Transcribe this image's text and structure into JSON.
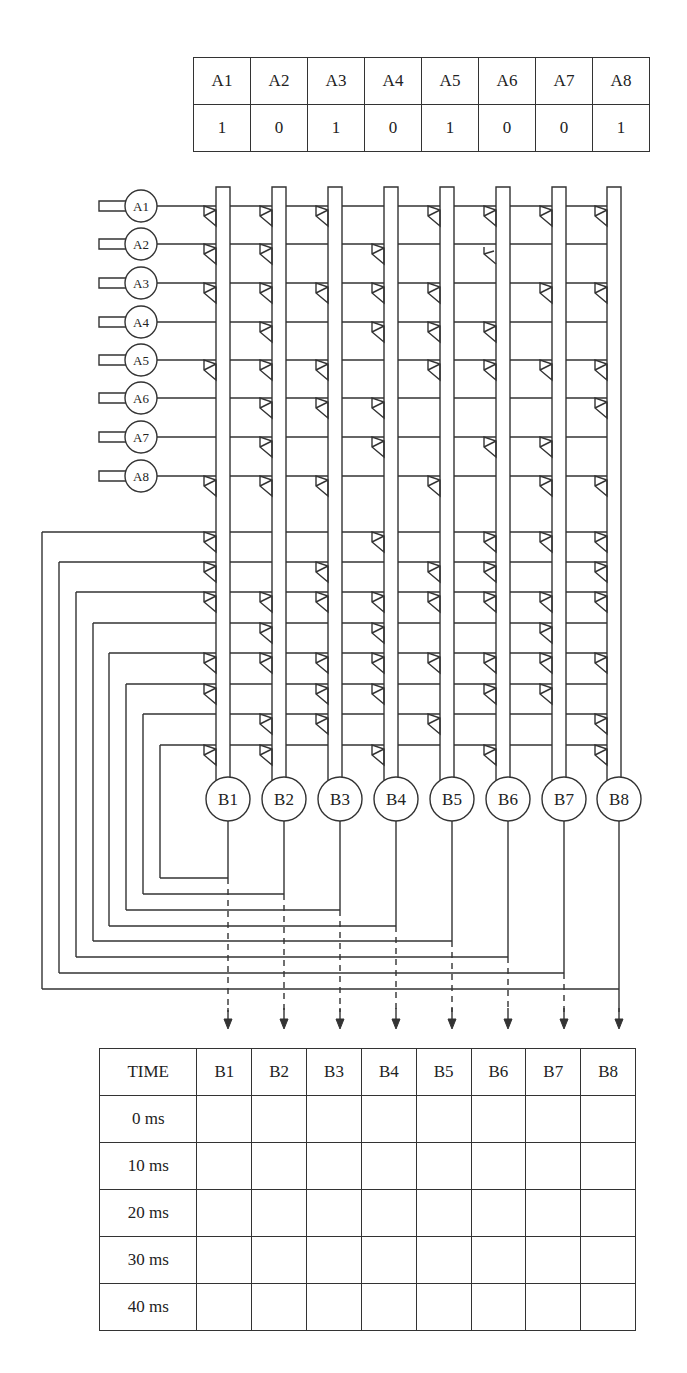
{
  "input_pattern_table": {
    "headers": [
      "A1",
      "A2",
      "A3",
      "A4",
      "A5",
      "A6",
      "A7",
      "A8"
    ],
    "values": [
      "1",
      "0",
      "1",
      "0",
      "1",
      "0",
      "0",
      "1"
    ]
  },
  "input_neurons": {
    "labels": [
      "A1",
      "A2",
      "A3",
      "A4",
      "A5",
      "A6",
      "A7",
      "A8"
    ]
  },
  "output_neurons": {
    "labels": [
      "B1",
      "B2",
      "B3",
      "B4",
      "B5",
      "B6",
      "B7",
      "B8"
    ]
  },
  "synapses": {
    "input_rows": [
      [
        1,
        2,
        3,
        5,
        6,
        7,
        8
      ],
      [
        1,
        2,
        4,
        6
      ],
      [
        1,
        2,
        3,
        4,
        5,
        7,
        8
      ],
      [
        2,
        4,
        5,
        6
      ],
      [
        1,
        2,
        3,
        5,
        6,
        7,
        8
      ],
      [
        2,
        3,
        4,
        8
      ],
      [
        2,
        4,
        6,
        7
      ],
      [
        1,
        2,
        3,
        5,
        7,
        8
      ]
    ],
    "open_synapses": [
      {
        "row": 2,
        "col": 6
      }
    ],
    "feedback_rows": [
      {
        "source": "B8",
        "cols": [
          1,
          4,
          6,
          7,
          8
        ]
      },
      {
        "source": "B7",
        "cols": [
          1,
          3,
          5,
          6,
          8
        ]
      },
      {
        "source": "B6",
        "cols": [
          1,
          2,
          3,
          4,
          5,
          6,
          7,
          8
        ]
      },
      {
        "source": "B5",
        "cols": [
          2,
          4,
          7
        ]
      },
      {
        "source": "B4",
        "cols": [
          1,
          2,
          3,
          4,
          5,
          6,
          7,
          8
        ]
      },
      {
        "source": "B3",
        "cols": [
          1,
          3,
          4,
          6,
          7
        ]
      },
      {
        "source": "B2",
        "cols": [
          2,
          3,
          5,
          8
        ]
      },
      {
        "source": "B1",
        "cols": [
          1,
          2,
          4,
          6,
          8
        ]
      }
    ]
  },
  "time_table": {
    "header": [
      "TIME",
      "B1",
      "B2",
      "B3",
      "B4",
      "B5",
      "B6",
      "B7",
      "B8"
    ],
    "rows": [
      {
        "time": "0 ms",
        "cells": [
          "",
          "",
          "",
          "",
          "",
          "",
          "",
          ""
        ]
      },
      {
        "time": "10 ms",
        "cells": [
          "",
          "",
          "",
          "",
          "",
          "",
          "",
          ""
        ]
      },
      {
        "time": "20 ms",
        "cells": [
          "",
          "",
          "",
          "",
          "",
          "",
          "",
          ""
        ]
      },
      {
        "time": "30 ms",
        "cells": [
          "",
          "",
          "",
          "",
          "",
          "",
          "",
          ""
        ]
      },
      {
        "time": "40 ms",
        "cells": [
          "",
          "",
          "",
          "",
          "",
          "",
          "",
          ""
        ]
      }
    ]
  },
  "colors": {
    "line": "#333333",
    "text": "#222222",
    "background": "#ffffff"
  }
}
